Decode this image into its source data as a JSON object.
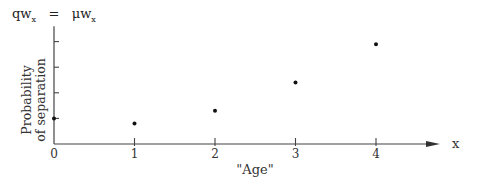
{
  "formula": {
    "lhs": "qw",
    "lhs_sub": "x",
    "eq": "=",
    "rhs": "μw",
    "rhs_sub": "x"
  },
  "chart_data": {
    "type": "scatter",
    "title": "",
    "xlabel": "\"Age\"",
    "ylabel_lines": [
      "Probability",
      "of separation"
    ],
    "x_axis_end_label": "x",
    "x_ticks": [
      0,
      1,
      2,
      3,
      4
    ],
    "x_tick_labels": [
      "0",
      "1",
      "2",
      "3",
      "4"
    ],
    "y_ticks": [
      1,
      2,
      3,
      4
    ],
    "y_tick_labels": [
      "",
      "",
      "",
      ""
    ],
    "xlim": [
      0,
      4.9
    ],
    "ylim": [
      0,
      4.4
    ],
    "grid": false,
    "legend": "none",
    "points": [
      {
        "x": 0,
        "y": 1.0
      },
      {
        "x": 1,
        "y": 0.8
      },
      {
        "x": 2,
        "y": 1.3
      },
      {
        "x": 3,
        "y": 2.4
      },
      {
        "x": 4,
        "y": 3.9
      }
    ]
  }
}
